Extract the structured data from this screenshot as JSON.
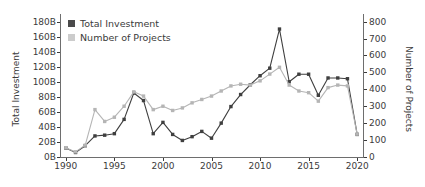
{
  "chart_data": {
    "type": "line",
    "title": "",
    "xlabel": "",
    "ylabel": "Total Investment",
    "y2label": "Number of Projects",
    "grid": false,
    "legend_position": "upper-left",
    "xlim": [
      1989.4,
      2020.6
    ],
    "ylim": [
      0,
      190
    ],
    "y2lim": [
      0,
      845
    ],
    "xticks": [
      1990,
      1995,
      2000,
      2005,
      2010,
      2015,
      2020
    ],
    "xticklabels": [
      "1990",
      "1995",
      "2000",
      "2005",
      "2010",
      "2015",
      "2020"
    ],
    "yticks": [
      0,
      20,
      40,
      60,
      80,
      100,
      120,
      140,
      160,
      180
    ],
    "yticklabels": [
      "0B",
      "20B",
      "40B",
      "60B",
      "80B",
      "100B",
      "120B",
      "140B",
      "160B",
      "180B"
    ],
    "y2ticks": [
      0,
      100,
      200,
      300,
      400,
      500,
      600,
      700,
      800
    ],
    "y2ticklabels": [
      "0",
      "100",
      "200",
      "300",
      "400",
      "500",
      "600",
      "700",
      "800"
    ],
    "x": [
      1990,
      1991,
      1992,
      1993,
      1994,
      1995,
      1996,
      1997,
      1998,
      1999,
      2000,
      2001,
      2002,
      2003,
      2004,
      2005,
      2006,
      2007,
      2008,
      2009,
      2010,
      2011,
      2012,
      2013,
      2014,
      2015,
      2016,
      2017,
      2018,
      2019,
      2020
    ],
    "series": [
      {
        "name": "Total Investment",
        "color": "#3f3f3f",
        "axis": "left",
        "marker": "square",
        "values": [
          12,
          6,
          15,
          28,
          29,
          31,
          50,
          85,
          75,
          31,
          46,
          30,
          22,
          27,
          34,
          25,
          45,
          67,
          83,
          96,
          108,
          118,
          170,
          100,
          110,
          110,
          82,
          105,
          105,
          104,
          30
        ]
      },
      {
        "name": "Number of Projects",
        "color": "#b5b5b5",
        "axis": "right",
        "marker": "square",
        "values": [
          55,
          30,
          70,
          280,
          210,
          235,
          300,
          385,
          360,
          280,
          300,
          275,
          290,
          320,
          340,
          360,
          390,
          420,
          430,
          425,
          450,
          490,
          530,
          425,
          390,
          380,
          330,
          410,
          425,
          420,
          135
        ]
      }
    ]
  },
  "legend": {
    "items": [
      {
        "label": "Total Investment",
        "color": "#4a4a4a"
      },
      {
        "label": "Number of Projects",
        "color": "#cccccc"
      }
    ]
  }
}
